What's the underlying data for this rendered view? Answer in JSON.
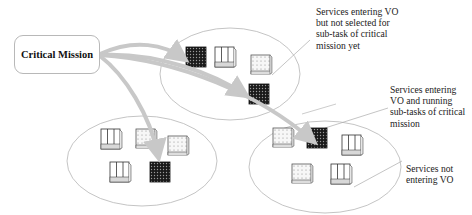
{
  "diagram": {
    "mission": {
      "label": "Critical Mission"
    },
    "labels": {
      "not_selected": "Services entering VO but not selected for sub-task of critical mission  yet",
      "running": "Services entering VO and running sub-tasks of critical mission",
      "not_entering": "Services not entering VO"
    },
    "legend_types": [
      {
        "id": "running",
        "style": "dark-dotted",
        "meaning": "Services entering VO and running sub-tasks of critical mission"
      },
      {
        "id": "not_selected",
        "style": "light-dotted",
        "meaning": "Services entering VO but not selected for sub-task of critical mission yet"
      },
      {
        "id": "not_entering",
        "style": "striped-outline",
        "meaning": "Services not entering VO"
      }
    ],
    "groups": [
      {
        "name": "vo-top",
        "services": [
          "running",
          "not_entering",
          "not_selected",
          "running"
        ]
      },
      {
        "name": "vo-bottom-left",
        "services": [
          "not_entering",
          "not_selected",
          "not_selected",
          "not_entering",
          "running"
        ]
      },
      {
        "name": "vo-bottom-right",
        "services": [
          "not_selected",
          "running",
          "not_entering",
          "not_selected",
          "not_entering"
        ]
      }
    ],
    "colors": {
      "arrow": "#c8c8c8",
      "ellipse": "#bdbdbd",
      "dark_service": "#1a1a1a",
      "light_service": "#f4f4f4"
    }
  }
}
